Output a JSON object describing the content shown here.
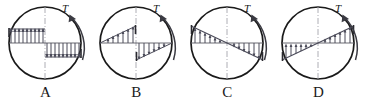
{
  "figure": {
    "type": "multiple-choice-diagram",
    "panel_count": 4,
    "colors": {
      "outline": "#1a1a1a",
      "distribution": "#4a4a58",
      "centerline": "#9a9aa2",
      "background": "#ffffff",
      "label": "#1a1a1a"
    },
    "circle": {
      "radius": 36,
      "center_x": 45,
      "center_y": 43
    }
  },
  "options": [
    {
      "id": "A",
      "label": "A",
      "torque_label": "T",
      "torque_direction": "counterclockwise",
      "distribution_shape": "uniform-rectangular-antisymmetric",
      "left_half": {
        "profile": "constant",
        "value_at_center": 1.0,
        "value_at_edge": 1.0,
        "arrow_direction": "up",
        "arrow_count": 9
      },
      "right_half": {
        "profile": "constant",
        "value_at_center": 1.0,
        "value_at_edge": 1.0,
        "arrow_direction": "down",
        "arrow_count": 9
      }
    },
    {
      "id": "B",
      "label": "B",
      "torque_label": "T",
      "torque_direction": "counterclockwise",
      "distribution_shape": "triangular-max-at-center",
      "left_half": {
        "profile": "linear",
        "value_at_center": 1.0,
        "value_at_edge": 0.0,
        "arrow_direction": "up",
        "arrow_count": 6
      },
      "right_half": {
        "profile": "linear",
        "value_at_center": 0.0,
        "value_at_edge": 1.0,
        "arrow_direction": "down",
        "arrow_count": 6
      }
    },
    {
      "id": "C",
      "label": "C",
      "torque_label": "T",
      "torque_direction": "counterclockwise",
      "distribution_shape": "triangular-max-at-outer-surface",
      "left_half": {
        "profile": "linear",
        "value_at_center": 0.0,
        "value_at_edge": 1.0,
        "arrow_direction": "up",
        "arrow_count": 6
      },
      "right_half": {
        "profile": "linear",
        "value_at_center": 0.0,
        "value_at_edge": 1.0,
        "arrow_direction": "down",
        "arrow_count": 6
      }
    },
    {
      "id": "D",
      "label": "D",
      "torque_label": "T",
      "torque_direction": "counterclockwise",
      "distribution_shape": "linear-single-slope-all-one-direction",
      "left_half": {
        "profile": "linear",
        "value_at_center": 0.0,
        "value_at_edge": 1.0,
        "arrow_direction": "up",
        "arrow_count": 6
      },
      "right_half": {
        "profile": "linear",
        "value_at_center": 0.0,
        "value_at_edge": 1.0,
        "arrow_direction": "up",
        "arrow_count": 6
      }
    }
  ]
}
